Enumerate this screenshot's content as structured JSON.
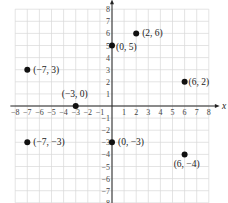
{
  "chart_data": {
    "type": "scatter",
    "title": "",
    "xlabel": "x",
    "ylabel": "y",
    "xlim": [
      -8,
      8
    ],
    "ylim": [
      -8,
      8
    ],
    "grid": true,
    "x_ticks": [
      -8,
      -7,
      -6,
      -5,
      -4,
      -3,
      -2,
      -1,
      1,
      2,
      3,
      4,
      5,
      6,
      7,
      8
    ],
    "y_ticks": [
      -8,
      -7,
      -6,
      -5,
      -4,
      -3,
      -2,
      -1,
      1,
      2,
      3,
      4,
      5,
      6,
      7,
      8
    ],
    "points": [
      {
        "x": -7,
        "y": 3,
        "label": "(−7, 3)"
      },
      {
        "x": 0,
        "y": 5,
        "label": "(0, 5)"
      },
      {
        "x": 2,
        "y": 6,
        "label": "(2, 6)"
      },
      {
        "x": 6,
        "y": 2,
        "label": "(6, 2)"
      },
      {
        "x": -3,
        "y": 0,
        "label": "(−3, 0)"
      },
      {
        "x": -7,
        "y": -3,
        "label": "(−7, −3)"
      },
      {
        "x": 0,
        "y": -3,
        "label": "(0, −3)"
      },
      {
        "x": 6,
        "y": -4,
        "label": "(6, −4)"
      }
    ]
  },
  "axis": {
    "x_name": "x",
    "color": "#222222",
    "grid_color": "#d8d8d8",
    "point_color": "#111111"
  }
}
